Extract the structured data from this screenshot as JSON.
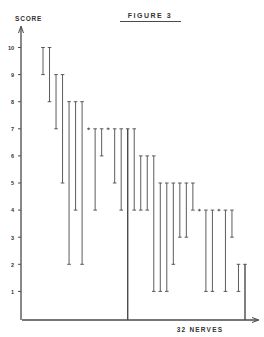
{
  "chart_data": {
    "type": "range-bar",
    "title": "FIGURE 3",
    "ylabel": "SCORE",
    "xlabel": "32 NERVES",
    "ylim": [
      0,
      10
    ],
    "yticks": [
      1,
      2,
      3,
      4,
      5,
      6,
      7,
      8,
      9,
      10
    ],
    "ytick_labels": [
      "1",
      "2",
      "3",
      "4",
      "5",
      "6",
      "7",
      "8",
      "9",
      "10"
    ],
    "grid": false,
    "legend": "none",
    "nerve_count": 32,
    "series": [
      {
        "name": "score range per nerve",
        "values": [
          [
            10,
            9
          ],
          [
            10,
            8
          ],
          [
            9,
            7
          ],
          [
            9,
            5
          ],
          [
            8,
            2
          ],
          [
            8,
            4
          ],
          [
            8,
            2
          ],
          [
            7,
            7
          ],
          [
            7,
            4
          ],
          [
            7,
            6
          ],
          [
            7,
            7
          ],
          [
            7,
            5
          ],
          [
            7,
            4
          ],
          [
            7,
            0
          ],
          [
            7,
            4
          ],
          [
            6,
            4
          ],
          [
            6,
            4
          ],
          [
            6,
            1
          ],
          [
            5,
            1
          ],
          [
            5,
            1
          ],
          [
            5,
            2
          ],
          [
            5,
            3
          ],
          [
            5,
            3
          ],
          [
            5,
            4
          ],
          [
            4,
            4
          ],
          [
            4,
            1
          ],
          [
            4,
            1
          ],
          [
            4,
            4
          ],
          [
            4,
            1
          ],
          [
            4,
            3
          ],
          [
            2,
            1
          ],
          [
            2,
            0
          ]
        ]
      }
    ]
  }
}
